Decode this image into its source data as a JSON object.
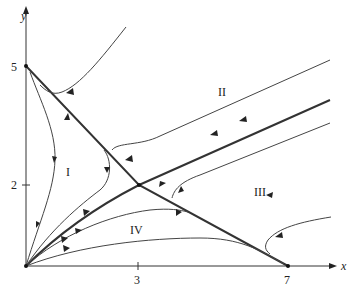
{
  "figure": {
    "type": "phase-portrait",
    "axes": {
      "x_label": "x",
      "y_label": "y",
      "x_ticks": [
        {
          "value": 3,
          "label": "3"
        },
        {
          "value": 7,
          "label": "7"
        }
      ],
      "y_ticks": [
        {
          "value": 2,
          "label": "2"
        },
        {
          "value": 5,
          "label": "5"
        }
      ]
    },
    "regions": [
      {
        "id": "I",
        "label": "I"
      },
      {
        "id": "II",
        "label": "II"
      },
      {
        "id": "III",
        "label": "III"
      },
      {
        "id": "IV",
        "label": "IV"
      }
    ],
    "equilibria": [
      {
        "name": "origin",
        "x": 0,
        "y": 0
      },
      {
        "name": "y-intercept",
        "x": 0,
        "y": 5
      },
      {
        "name": "x-intercept",
        "x": 7,
        "y": 0
      },
      {
        "name": "saddle",
        "x": 3,
        "y": 2
      }
    ],
    "colors": {
      "line": "#333333",
      "background": "#ffffff"
    }
  }
}
